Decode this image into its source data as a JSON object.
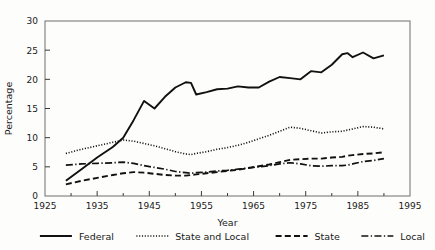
{
  "chart_data": {
    "type": "line",
    "title": "",
    "xlabel": "Year",
    "ylabel": "Percentage",
    "xlim": [
      1925,
      1995
    ],
    "ylim": [
      0,
      30
    ],
    "xticks": [
      1925,
      1935,
      1945,
      1955,
      1965,
      1975,
      1985,
      1995
    ],
    "xticks_minor": [
      1930,
      1940,
      1950,
      1960,
      1970,
      1980,
      1990
    ],
    "yticks": [
      0,
      5,
      10,
      15,
      20,
      25,
      30
    ],
    "grid": false,
    "legend_position": "below",
    "x": [
      1929,
      1932,
      1935,
      1938,
      1940,
      1942,
      1944,
      1946,
      1948,
      1950,
      1952,
      1953,
      1954,
      1956,
      1958,
      1960,
      1962,
      1964,
      1966,
      1968,
      1970,
      1972,
      1974,
      1976,
      1978,
      1980,
      1982,
      1983,
      1984,
      1986,
      1988,
      1990
    ],
    "series": [
      {
        "name": "Federal",
        "style": "solid",
        "values": [
          2.6,
          4.6,
          6.6,
          8.4,
          10.0,
          13.0,
          16.3,
          15.0,
          17.0,
          18.6,
          19.5,
          19.4,
          17.4,
          17.8,
          18.3,
          18.4,
          18.8,
          18.6,
          18.6,
          19.6,
          20.4,
          20.2,
          20.0,
          21.4,
          21.2,
          22.5,
          24.3,
          24.5,
          23.8,
          24.6,
          23.6,
          24.1
        ],
        "color": "#111111"
      },
      {
        "name": "State and Local",
        "style": "dotted",
        "values": [
          7.3,
          8.0,
          8.6,
          9.2,
          9.6,
          9.4,
          9.0,
          8.6,
          8.1,
          7.6,
          7.2,
          7.1,
          7.3,
          7.6,
          8.0,
          8.3,
          8.7,
          9.2,
          9.8,
          10.4,
          11.1,
          11.8,
          11.6,
          11.2,
          10.8,
          11.0,
          11.1,
          11.3,
          11.5,
          11.9,
          11.8,
          11.5
        ],
        "color": "#111111"
      },
      {
        "name": "State",
        "style": "dashed",
        "values": [
          2.0,
          2.6,
          3.1,
          3.6,
          3.9,
          4.1,
          4.0,
          3.8,
          3.6,
          3.5,
          3.5,
          3.6,
          3.7,
          3.9,
          4.1,
          4.3,
          4.5,
          4.8,
          5.1,
          5.4,
          5.8,
          6.2,
          6.3,
          6.4,
          6.4,
          6.6,
          6.7,
          6.9,
          7.0,
          7.2,
          7.3,
          7.5
        ],
        "color": "#111111"
      },
      {
        "name": "Local",
        "style": "dashdot",
        "values": [
          5.3,
          5.5,
          5.6,
          5.7,
          5.8,
          5.6,
          5.2,
          4.9,
          4.6,
          4.2,
          4.0,
          3.9,
          4.0,
          4.1,
          4.3,
          4.4,
          4.6,
          4.8,
          5.0,
          5.2,
          5.5,
          5.7,
          5.5,
          5.2,
          5.1,
          5.2,
          5.2,
          5.3,
          5.5,
          5.9,
          6.1,
          6.4
        ],
        "color": "#111111"
      }
    ],
    "legend": [
      {
        "label": "Federal",
        "style": "solid"
      },
      {
        "label": "State and Local",
        "style": "dotted"
      },
      {
        "label": "State",
        "style": "dashed"
      },
      {
        "label": "Local",
        "style": "dashdot"
      }
    ]
  }
}
